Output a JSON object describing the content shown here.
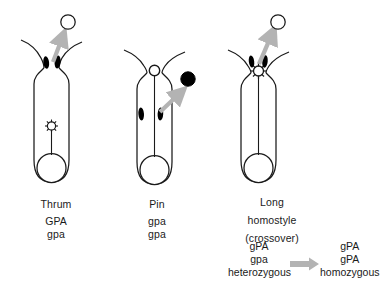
{
  "figure": {
    "background_color": "#ffffff",
    "line_color": "#1a1a1a",
    "anther_color": "#000000",
    "arrow_color": "#b3b3b3",
    "pollen_open_color": "#ffffff",
    "pollen_filled_color": "#000000"
  },
  "panels": [
    {
      "id": "thrum",
      "name_label": "Thrum",
      "name_lines": [
        "Thrum"
      ],
      "genotype_lines": [
        "GPA",
        "gpa"
      ],
      "anther_position": "high",
      "stigma_position": "low",
      "pollen_marker": "open-circle",
      "arrow_direction": "up-right",
      "icon_names": [
        "corolla-tube",
        "anther-high-left",
        "anther-high-right",
        "stigma-low",
        "style-short",
        "ovary",
        "pollen-open-circle",
        "pollen-transfer-arrow"
      ]
    },
    {
      "id": "pin",
      "name_label": "Pin",
      "name_lines": [
        "Pin"
      ],
      "genotype_lines": [
        "gpa",
        "gpa"
      ],
      "anther_position": "low",
      "stigma_position": "high",
      "pollen_marker": "filled-circle",
      "arrow_direction": "up-right",
      "icon_names": [
        "corolla-tube",
        "anther-low-left",
        "anther-low-right",
        "stigma-high",
        "style-long",
        "ovary",
        "pollen-filled-circle",
        "pollen-transfer-arrow"
      ]
    },
    {
      "id": "long-homostyle",
      "name_label": "Long homostyle (crossover)",
      "name_lines": [
        "Long",
        "homostyle",
        "(crossover)"
      ],
      "genotype_lines": [],
      "anther_position": "high",
      "stigma_position": "high",
      "pollen_marker": "open-circle",
      "arrow_direction": "up-right",
      "icon_names": [
        "corolla-tube",
        "anther-high-left",
        "anther-high-right",
        "stigma-high",
        "style-long",
        "ovary",
        "pollen-open-circle",
        "pollen-transfer-arrow"
      ]
    }
  ],
  "crossover": {
    "left": {
      "allele_top": "gPA",
      "allele_bottom": "gpa",
      "zygosity": "heterozygous"
    },
    "arrow": {
      "name": "crossover-arrow",
      "direction": "right"
    },
    "right": {
      "allele_top": "gPA",
      "allele_bottom": "gPA",
      "zygosity": "homozygous"
    }
  }
}
